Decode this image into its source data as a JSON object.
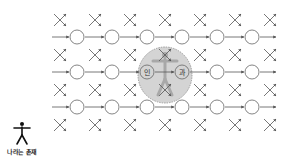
{
  "diagram": {
    "type": "causal-network",
    "grid": {
      "cross_columns_x": [
        60,
        95,
        130,
        165,
        200,
        235,
        270
      ],
      "cross_rows_y": [
        20,
        55,
        90,
        125
      ],
      "node_columns_x": [
        77,
        112,
        147,
        182,
        217,
        252
      ],
      "node_rows_y": [
        37,
        72,
        107
      ],
      "node_radius": 7,
      "arrow_color": "#555555",
      "node_stroke": "#666666"
    },
    "highlight": {
      "cx": 165,
      "cy": 75,
      "rx": 27,
      "ry": 28,
      "fill": "#d4d4d4",
      "stroke": "#888888",
      "left_node_label": "인",
      "right_node_label": "과"
    },
    "person_figure": {
      "x": 22,
      "y": 127,
      "color": "#111111"
    },
    "caption": "나라는 존재"
  }
}
